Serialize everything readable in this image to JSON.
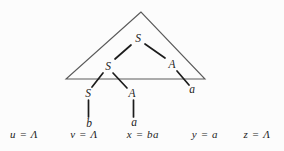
{
  "diagram": {
    "type": "derivation-tree",
    "background_color": "#fcfcfc",
    "ink_color": "#1c1c1c",
    "triangle_color": "#5a5a5a",
    "triangle": {
      "points": [
        [
          141,
          12
        ],
        [
          66,
          79
        ],
        [
          205,
          79
        ]
      ]
    },
    "nodes": [
      {
        "id": "S-root",
        "label": "S",
        "x": 138,
        "y": 42
      },
      {
        "id": "S-mid",
        "label": "S",
        "x": 108,
        "y": 70
      },
      {
        "id": "A-mid",
        "label": "A",
        "x": 172,
        "y": 68
      },
      {
        "id": "S-low",
        "label": "S",
        "x": 88,
        "y": 97
      },
      {
        "id": "A-low",
        "label": "A",
        "x": 132,
        "y": 97
      },
      {
        "id": "a-right",
        "label": "a",
        "x": 192,
        "y": 93
      },
      {
        "id": "b-leaf",
        "label": "b",
        "x": 89,
        "y": 127
      },
      {
        "id": "a-leaf",
        "label": "a",
        "x": 134,
        "y": 126
      }
    ],
    "edges": [
      {
        "from": "S-root",
        "to": "S-mid",
        "x1": 131,
        "y1": 45,
        "x2": 115,
        "y2": 59
      },
      {
        "from": "S-root",
        "to": "A-mid",
        "x1": 145,
        "y1": 44,
        "x2": 165,
        "y2": 58
      },
      {
        "from": "S-mid",
        "to": "S-low",
        "x1": 103,
        "y1": 73,
        "x2": 92,
        "y2": 87
      },
      {
        "from": "S-mid",
        "to": "A-low",
        "x1": 113,
        "y1": 73,
        "x2": 127,
        "y2": 88
      },
      {
        "from": "A-mid",
        "to": "a-right",
        "x1": 177,
        "y1": 71,
        "x2": 189,
        "y2": 85
      },
      {
        "from": "S-low",
        "to": "b-leaf",
        "x1": 88.5,
        "y1": 100,
        "x2": 88.5,
        "y2": 117
      },
      {
        "from": "A-low",
        "to": "a-leaf",
        "x1": 133.5,
        "y1": 100,
        "x2": 133.5,
        "y2": 117
      }
    ],
    "equations": [
      {
        "id": "u",
        "text": "u = Λ",
        "x": 24,
        "y": 138
      },
      {
        "id": "v",
        "text": "v = Λ",
        "x": 84,
        "y": 138
      },
      {
        "id": "x",
        "text": "x = ba",
        "x": 143,
        "y": 138
      },
      {
        "id": "y",
        "text": "y = a",
        "x": 205,
        "y": 138
      },
      {
        "id": "z",
        "text": "z = Λ",
        "x": 257,
        "y": 138
      }
    ]
  }
}
